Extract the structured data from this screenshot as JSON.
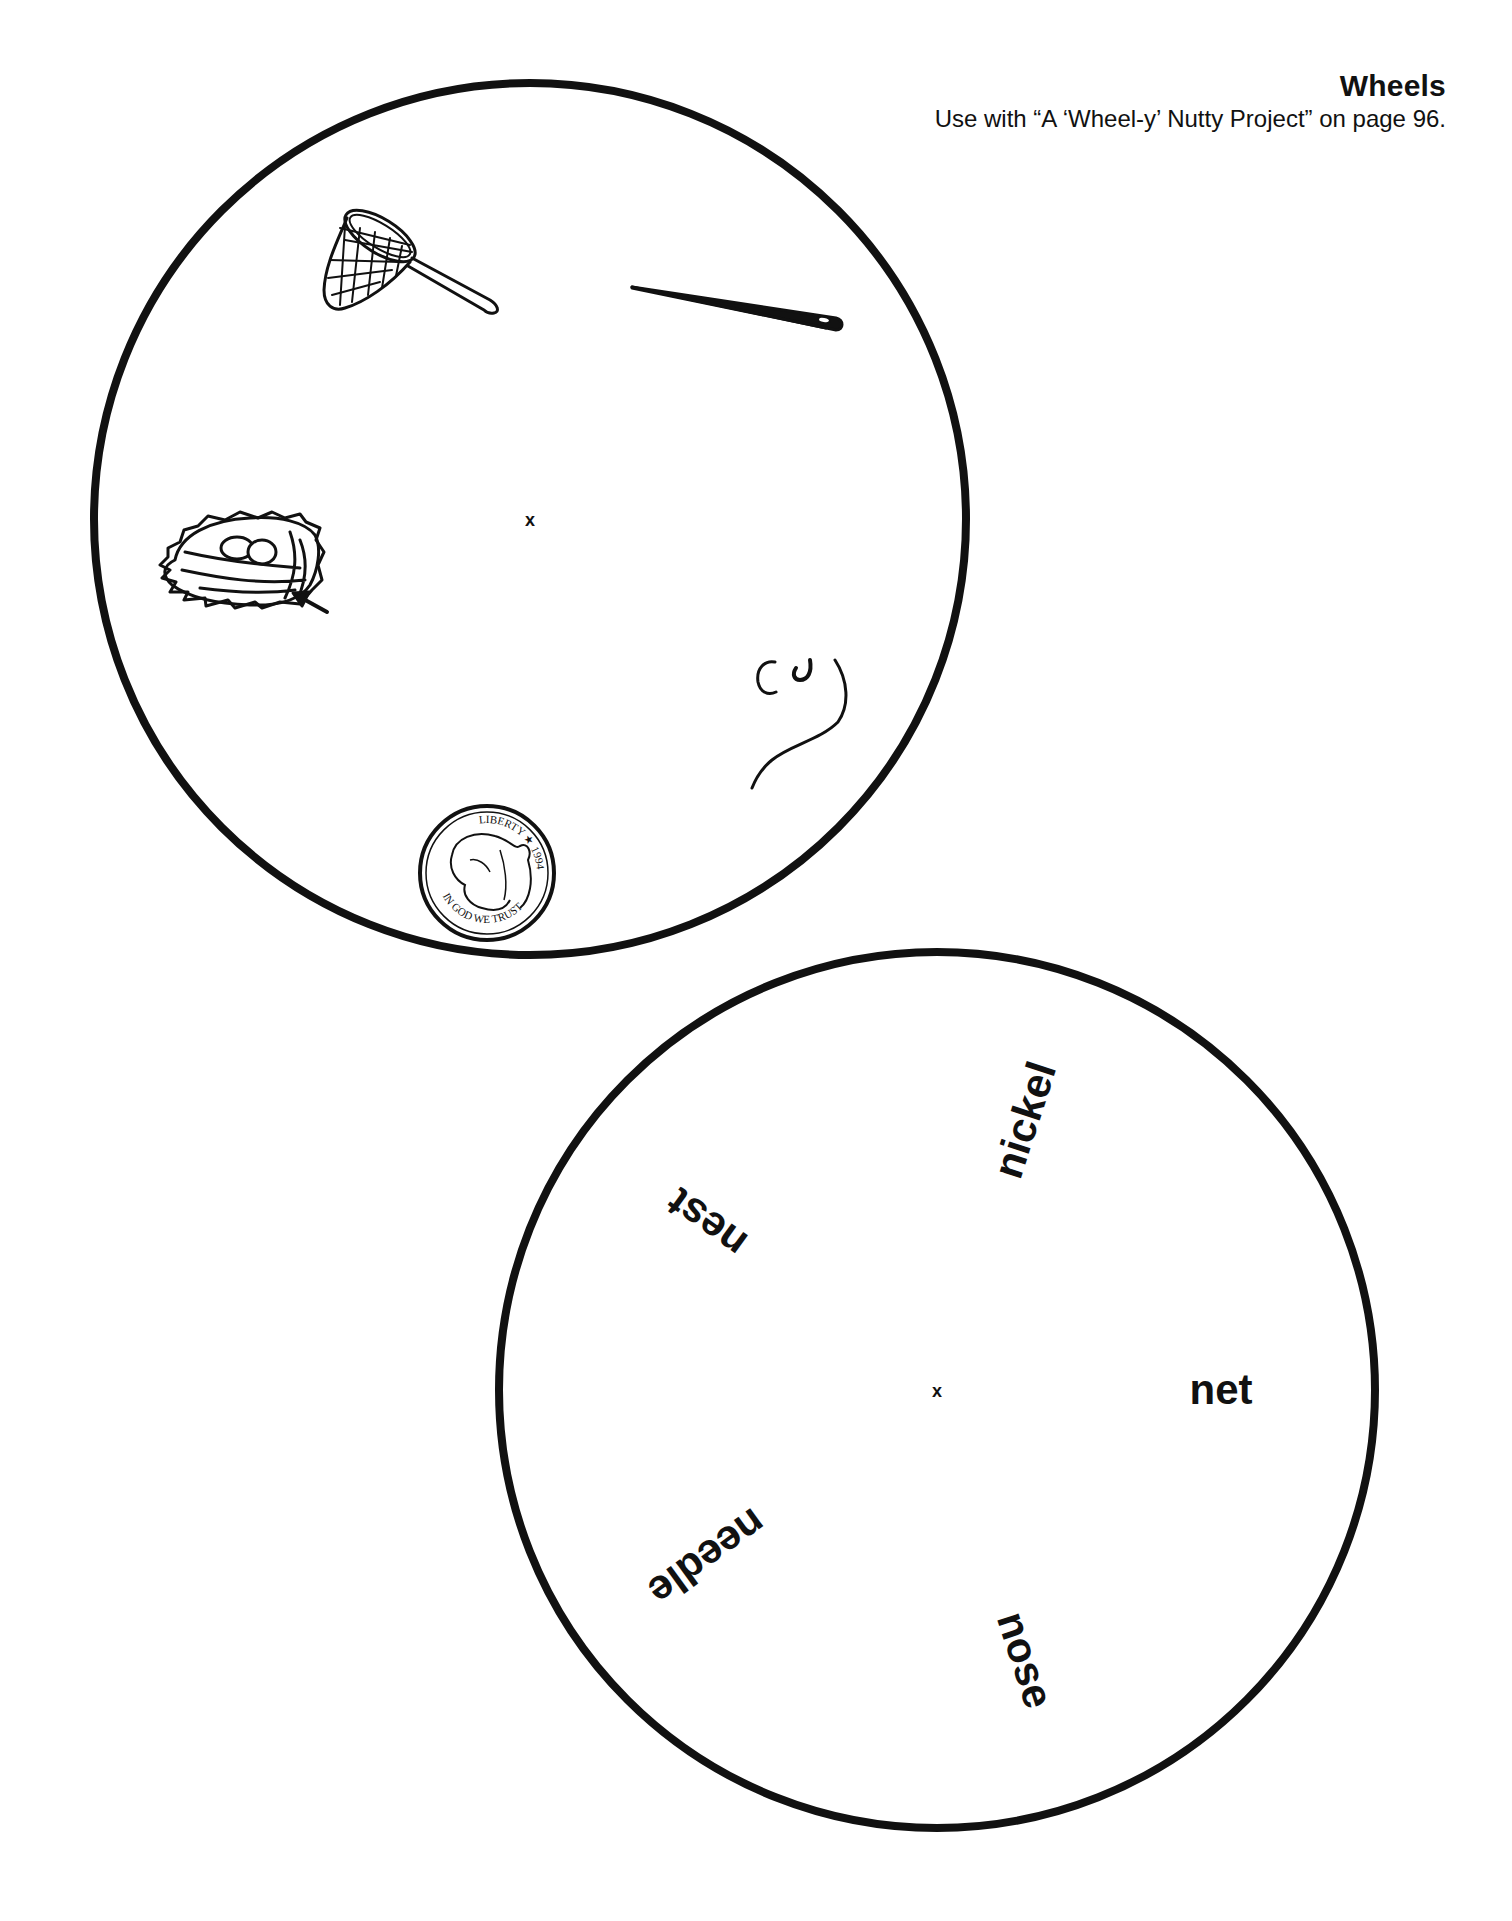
{
  "header": {
    "title": "Wheels",
    "subtitle": "Use with “A ‘Wheel-y’ Nutty Project” on page 96."
  },
  "picture_wheel": {
    "center_mark": "x",
    "pictures": [
      {
        "name": "net-icon",
        "label": "butterfly net"
      },
      {
        "name": "needle-icon",
        "label": "needle"
      },
      {
        "name": "nest-icon",
        "label": "bird nest with eggs and arrow"
      },
      {
        "name": "nose-icon",
        "label": "nose"
      },
      {
        "name": "nickel-icon",
        "label": "nickel coin",
        "coin_text_top": "LIBERTY ★ 1994",
        "coin_text_bottom": "IN GOD WE TRUST"
      }
    ]
  },
  "word_wheel": {
    "center_mark": "x",
    "words": [
      {
        "text": "net",
        "angle": 0
      },
      {
        "text": "nose",
        "angle": 72
      },
      {
        "text": "needle",
        "angle": 144
      },
      {
        "text": "nest",
        "angle": 216
      },
      {
        "text": "nickel",
        "angle": 288
      }
    ]
  }
}
